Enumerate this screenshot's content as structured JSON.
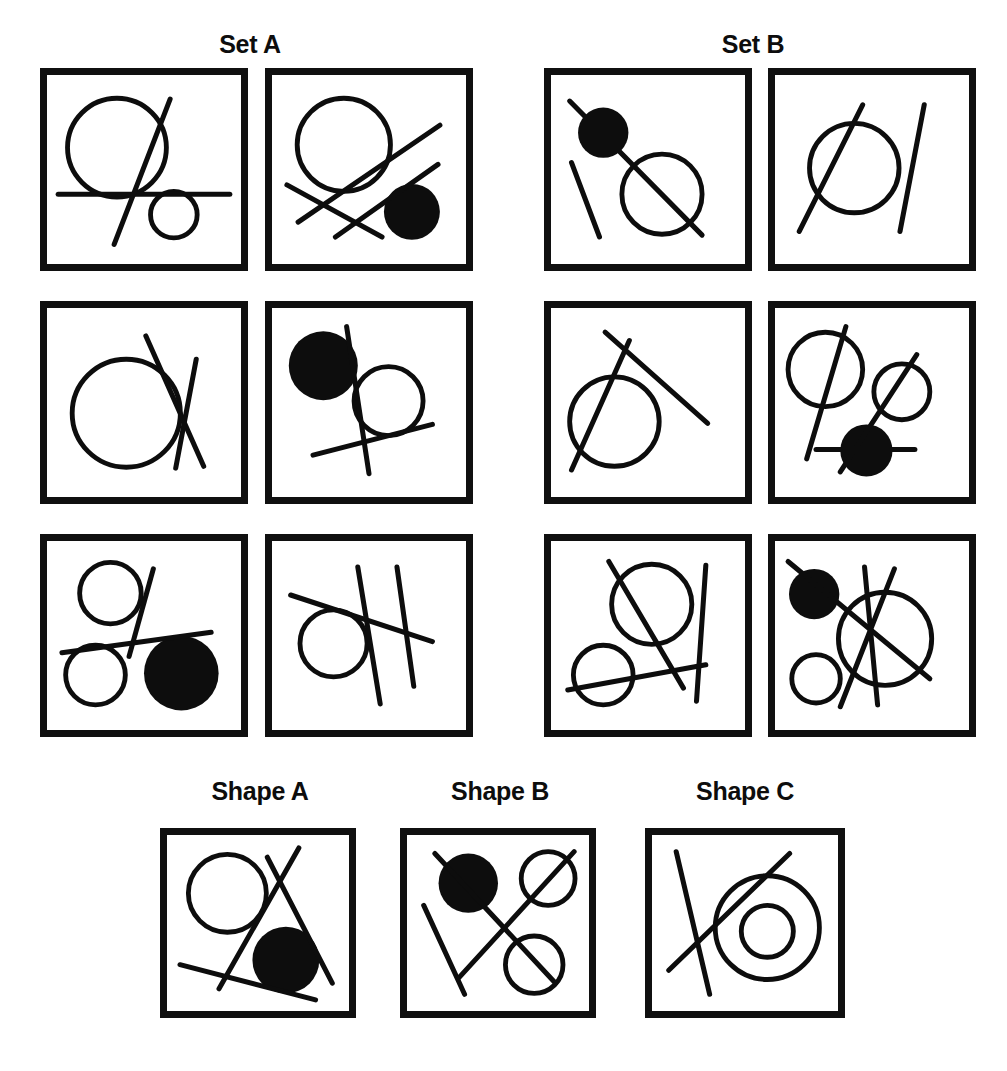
{
  "figure": {
    "type": "visual-reasoning-puzzle"
  },
  "sets": [
    {
      "id": "set-a",
      "label": "Set A",
      "panels": [
        {
          "id": "a1",
          "open_circles": 2,
          "filled_circles": 0,
          "lines": 2,
          "lines_through_circles": 0
        },
        {
          "id": "a2",
          "open_circles": 1,
          "filled_circles": 1,
          "lines": 3,
          "lines_through_circles": 0
        },
        {
          "id": "a3",
          "open_circles": 1,
          "filled_circles": 0,
          "lines": 2,
          "lines_through_circles": 0
        },
        {
          "id": "a4",
          "open_circles": 1,
          "filled_circles": 1,
          "lines": 2,
          "lines_through_circles": 0
        },
        {
          "id": "a5",
          "open_circles": 2,
          "filled_circles": 1,
          "lines": 2,
          "lines_through_circles": 0
        },
        {
          "id": "a6",
          "open_circles": 1,
          "filled_circles": 0,
          "lines": 3,
          "lines_through_circles": 0
        }
      ]
    },
    {
      "id": "set-b",
      "label": "Set B",
      "panels": [
        {
          "id": "b1",
          "open_circles": 1,
          "filled_circles": 1,
          "lines": 2,
          "lines_through_circles": 2
        },
        {
          "id": "b2",
          "open_circles": 1,
          "filled_circles": 0,
          "lines": 2,
          "lines_through_circles": 1
        },
        {
          "id": "b3",
          "open_circles": 1,
          "filled_circles": 0,
          "lines": 2,
          "lines_through_circles": 1
        },
        {
          "id": "b4",
          "open_circles": 2,
          "filled_circles": 1,
          "lines": 3,
          "lines_through_circles": 3
        },
        {
          "id": "b5",
          "open_circles": 2,
          "filled_circles": 0,
          "lines": 3,
          "lines_through_circles": 2
        },
        {
          "id": "b6",
          "open_circles": 2,
          "filled_circles": 1,
          "lines": 3,
          "lines_through_circles": 3
        }
      ]
    }
  ],
  "candidates": [
    {
      "id": "shape-a",
      "label": "Shape A",
      "open_circles": 1,
      "filled_circles": 1,
      "lines": 3,
      "lines_through_circles": 0
    },
    {
      "id": "shape-b",
      "label": "Shape B",
      "open_circles": 2,
      "filled_circles": 1,
      "lines": 3,
      "lines_through_circles": 3
    },
    {
      "id": "shape-c",
      "label": "Shape C",
      "open_circles": 2,
      "filled_circles": 0,
      "lines": 2,
      "lines_through_circles": 1
    }
  ],
  "colors": {
    "ink": "#0d0d0d",
    "background": "#ffffff",
    "panel_border": "#101010"
  }
}
